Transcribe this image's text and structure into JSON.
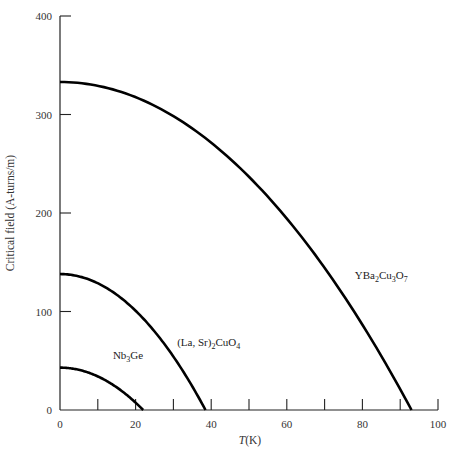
{
  "chart_data": {
    "type": "line",
    "title": "",
    "xlabel": "T(K)",
    "xlabel_italic_part": "T",
    "xlabel_unit": "(K)",
    "ylabel": "Critical field (A-turns/m)",
    "xlim": [
      0,
      100
    ],
    "ylim": [
      0,
      400
    ],
    "x_ticks": [
      0,
      10,
      20,
      30,
      40,
      50,
      60,
      70,
      80,
      90,
      100
    ],
    "x_tick_labels": [
      "0",
      "20",
      "40",
      "60",
      "80",
      "100"
    ],
    "x_tick_label_values": [
      0,
      20,
      40,
      60,
      80,
      100
    ],
    "y_ticks": [
      0,
      100,
      200,
      300,
      400
    ],
    "y_tick_labels": [
      "0",
      "100",
      "200",
      "300",
      "400"
    ],
    "grid": false,
    "legend": "inline labels",
    "model": "Hc = H0 * (1 - (T/Tc)^2)",
    "series": [
      {
        "name": "Nb3Ge",
        "label_main": "Nb",
        "label_sub": "3",
        "label_rest": "Ge",
        "H0": 43,
        "Tc": 22,
        "label_pos": [
          14,
          52
        ],
        "x": [
          0,
          5,
          10,
          15,
          20,
          22
        ],
        "values": [
          43,
          40.8,
          34.1,
          23.0,
          7.5,
          0
        ]
      },
      {
        "name": "(La, Sr)2CuO4",
        "label_main": "(La, Sr)",
        "label_sub": "2",
        "label_rest": "CuO",
        "label_sub2": "4",
        "H0": 138,
        "Tc": 38.5,
        "label_pos": [
          31,
          65
        ],
        "x": [
          0,
          10,
          20,
          30,
          35,
          38.5
        ],
        "values": [
          138,
          128.7,
          100.8,
          54.2,
          23.9,
          0
        ]
      },
      {
        "name": "YBa2Cu3O7",
        "label_main": "YBa",
        "label_sub": "2",
        "label_rest": "Cu",
        "label_sub2": "3",
        "label_rest2": "O",
        "label_sub3": "7",
        "H0": 333,
        "Tc": 93,
        "label_pos": [
          78,
          133
        ],
        "x": [
          0,
          20,
          40,
          60,
          80,
          93
        ],
        "values": [
          333,
          317.6,
          271.4,
          194.4,
          86.6,
          0
        ]
      }
    ]
  }
}
